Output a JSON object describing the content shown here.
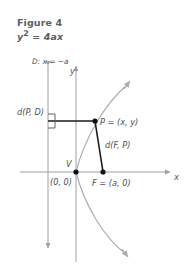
{
  "figure": {
    "title": "Figure 4",
    "equation_base": "y",
    "equation_exp": "2",
    "equation_rest": " = 4ax"
  },
  "labels": {
    "directrix": "D: x = −a",
    "y_axis": "y",
    "x_axis": "x",
    "dist_point_directrix": "d(P, D)",
    "dist_focus_point": "d(F, P)",
    "point_p": "P = (x, y)",
    "vertex": "V",
    "origin": "(0, 0)",
    "focus": "F = (a, 0)"
  },
  "colors": {
    "axis": "#9aa0a6",
    "curve": "#a7adb3",
    "segment": "#1a1a1a",
    "text": "#4c5055",
    "caption": "#5b5f66",
    "background": "#ffffff"
  },
  "geometry": {
    "origin_px": [
      76,
      172
    ],
    "focus_px": [
      103,
      172
    ],
    "point_p_px": [
      95,
      121
    ],
    "directrix_x_px": 48,
    "x_axis_y_px": 172
  }
}
